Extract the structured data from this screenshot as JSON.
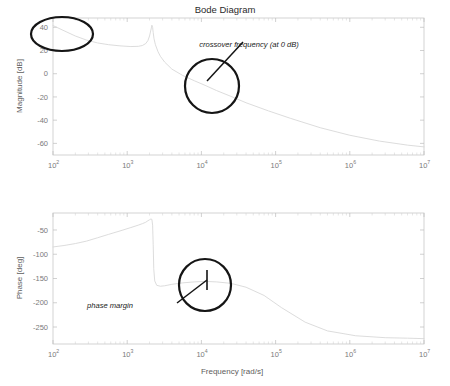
{
  "figure": {
    "title": "Bode Diagram",
    "width": 450,
    "height": 386
  },
  "chart_data": {
    "type": "line",
    "title": "Bode Diagram",
    "xlabel": "Frequency [rad/s]",
    "xscale": "log",
    "xlim": [
      100,
      10000000
    ],
    "grid": false,
    "legend": "none",
    "subplots": [
      {
        "name": "magnitude",
        "ylabel": "Magnitude [dB]",
        "ylim": [
          -70,
          48
        ],
        "yticks": [
          40,
          20,
          0,
          -20,
          -40,
          -60
        ],
        "ytick_labels": [
          "40",
          "20",
          "0",
          "-20",
          "-40",
          "-60"
        ],
        "xticks": [
          100,
          1000,
          10000,
          100000,
          1000000,
          10000000
        ],
        "xtick_labels": [
          "10^2",
          "10^3",
          "10^4",
          "10^5",
          "10^6",
          "10^7"
        ],
        "series": [
          {
            "name": "magnitude-response",
            "color": "#d8d8d8",
            "x": [
              100,
              141,
              200,
              282,
              400,
              562,
              800,
              1120,
              1410,
              1600,
              1780,
              1900,
              2000,
              2100,
              2150,
              2200,
              2240,
              2300,
              2400,
              2600,
              2800,
              3200,
              4000,
              5600,
              8000,
              11200,
              16000,
              25000,
              40000,
              80000,
              160000,
              400000,
              1000000,
              2500000,
              6000000,
              10000000
            ],
            "y": [
              41.5,
              37.0,
              32.5,
              29.0,
              26.5,
              25.0,
              24.0,
              23.4,
              23.6,
              24.3,
              26.0,
              28.5,
              32.5,
              38.5,
              41.8,
              40.0,
              35.5,
              30.0,
              25.0,
              19.0,
              15.0,
              10.0,
              4.0,
              -1.5,
              -6.0,
              -10.0,
              -14.5,
              -19.5,
              -25.0,
              -32.0,
              -38.5,
              -46.5,
              -53.0,
              -58.0,
              -61.5,
              -63.0
            ]
          }
        ]
      },
      {
        "name": "phase",
        "ylabel": "Phase [deg]",
        "ylim": [
          -285,
          -15
        ],
        "yticks": [
          -50,
          -100,
          -150,
          -200,
          -250
        ],
        "ytick_labels": [
          "-50",
          "-100",
          "-150",
          "-200",
          "-250"
        ],
        "xticks": [
          100,
          1000,
          10000,
          100000,
          1000000,
          10000000
        ],
        "xtick_labels": [
          "10^2",
          "10^3",
          "10^4",
          "10^5",
          "10^6",
          "10^7"
        ],
        "series": [
          {
            "name": "phase-response",
            "color": "#d8d8d8",
            "x": [
              100,
              141,
              200,
              282,
              400,
              562,
              800,
              1120,
              1410,
              1600,
              1780,
              1900,
              2000,
              2080,
              2150,
              2200,
              2240,
              2280,
              2350,
              2500,
              2800,
              3200,
              4000,
              5600,
              8000,
              11200,
              16000,
              25000,
              40000,
              70000,
              120000,
              250000,
              500000,
              1200000,
              3000000,
              6000000,
              10000000
            ],
            "y": [
              -85,
              -82,
              -78,
              -73,
              -66,
              -59,
              -52,
              -45,
              -40,
              -37,
              -34,
              -31,
              -29,
              -27.5,
              -28,
              -40,
              -80,
              -130,
              -155,
              -164,
              -166,
              -165,
              -162,
              -159,
              -157,
              -156,
              -157,
              -160,
              -168,
              -185,
              -210,
              -240,
              -258,
              -268,
              -272,
              -273,
              -274
            ]
          }
        ]
      }
    ]
  },
  "annotations": [
    {
      "name": "crossover-frequency",
      "label": "crossover frequency (at 0 dB)",
      "label_x": 249,
      "label_y": 47,
      "shape": "circle",
      "cx": 212,
      "cy": 86,
      "rx": 27,
      "ry": 27,
      "leader": {
        "x1": 243,
        "y1": 42,
        "x2": 207,
        "y2": 81
      }
    },
    {
      "name": "magnitude-lowfreq-highlight",
      "label": "",
      "shape": "ellipse",
      "cx": 62,
      "cy": 34,
      "rx": 31,
      "ry": 17,
      "leader": null
    },
    {
      "name": "phase-margin",
      "label": "phase margin",
      "label_x": 110,
      "label_y": 308,
      "shape": "circle",
      "cx": 205,
      "cy": 285,
      "rx": 26,
      "ry": 26,
      "leader": {
        "x1": 177,
        "y1": 303,
        "x2": 207,
        "y2": 280
      },
      "marker": {
        "x": 207,
        "y1": 270,
        "y2": 290
      }
    }
  ]
}
